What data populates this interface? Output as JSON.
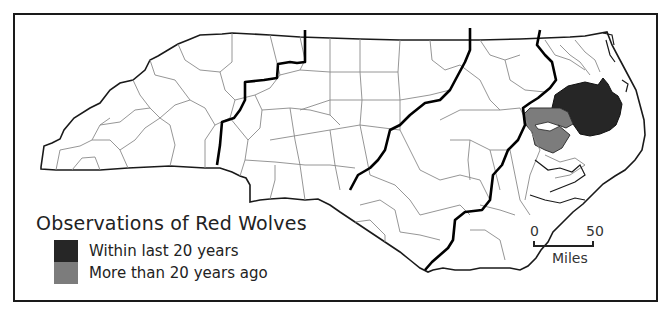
{
  "legend": {
    "title": "Observations of Red Wolves",
    "items": [
      {
        "label": "Within last 20 years",
        "color": "#262626"
      },
      {
        "label": "More than 20 years ago",
        "color": "#7c7c7c"
      }
    ]
  },
  "scale_bar": {
    "start_label": "0",
    "end_label": "50",
    "unit_label": "Miles"
  },
  "map": {
    "region": "North Carolina counties",
    "outline_color": "#1a1a1a",
    "county_line_color": "#8a8a8a",
    "region_divider_color": "#000000",
    "recent_color": "#262626",
    "historic_color": "#7c7c7c"
  }
}
